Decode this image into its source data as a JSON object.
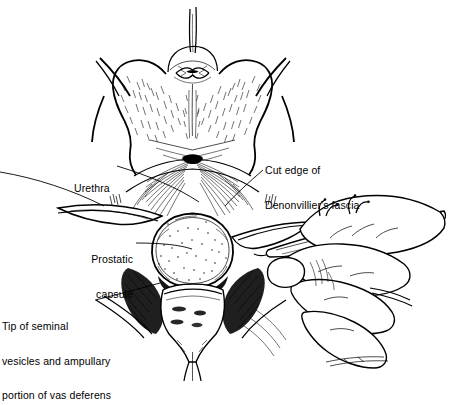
{
  "figure": {
    "background_color": "#ffffff",
    "ink_color": "#000000",
    "width": 452,
    "height": 381,
    "style": "black-and-white pen-and-ink medical line drawing with stipple and cross-hatch shading"
  },
  "labels": [
    {
      "id": "urethra",
      "name": "urethra-label",
      "lines": [
        "Urethra"
      ],
      "x": 74,
      "y": 160,
      "align": "left",
      "leader": "from right of text, angling down and right to the midline urethral stump"
    },
    {
      "id": "denonvillier",
      "name": "denonvilliers-fascia-label",
      "lines": [
        "Cut edge of",
        "Denonvillier's fascia"
      ],
      "x": 265,
      "y": 142,
      "align": "left",
      "leader": "from lower-left of text, angling down and left to the cut fascial edge"
    },
    {
      "id": "prostatic_capsule",
      "name": "prostatic-capsule-label",
      "lines": [
        "Prostatic",
        "capsule"
      ],
      "x": 55,
      "y": 231,
      "align": "right",
      "leader": "from right of second line, running right to the centre of the prostatic capsule"
    },
    {
      "id": "seminal_vesicles",
      "name": "seminal-vesicles-label",
      "lines": [
        "Tip of seminal",
        "vesicles and ampullary",
        "portion of vas deferens"
      ],
      "x": 2,
      "y": 298,
      "align": "left",
      "leader": "from right of first line, angling up and right to the seminal vesicle tips"
    }
  ],
  "anatomy": [
    {
      "name": "bladder",
      "description": "large bilobed bladder occupying the upper half, shaded with fine stipple hatching"
    },
    {
      "name": "catheter-sutures",
      "description": "two thin parallel strands emerging from the bladder dome at the top centre"
    },
    {
      "name": "bladder-neck",
      "description": "small rounded dome at the top of the bladder with a puckered opening"
    },
    {
      "name": "denonvilliers-fascia",
      "description": "fan-shaped cut fascial edge spreading laterally below the bladder"
    },
    {
      "name": "prostatic-capsule",
      "description": "central rounded stippled mass, the prostate, at mid-image"
    },
    {
      "name": "seminal-vesicles",
      "description": "structure below the prostate with dark cross-hatched shading at its sides"
    },
    {
      "name": "vas-deferens",
      "description": "ampullary portion flanking the seminal vesicles"
    },
    {
      "name": "retractor-blades",
      "description": "long pale bands passing from lower-left up to the right across the wound"
    }
  ],
  "instruments": [
    {
      "name": "surgeon-hand",
      "description": "gloved hand entering from the right, thumb above and fingers curled below"
    },
    {
      "name": "scalpel",
      "description": "scalpel held in the hand, blade pointing left toward the prostatic apex"
    }
  ]
}
